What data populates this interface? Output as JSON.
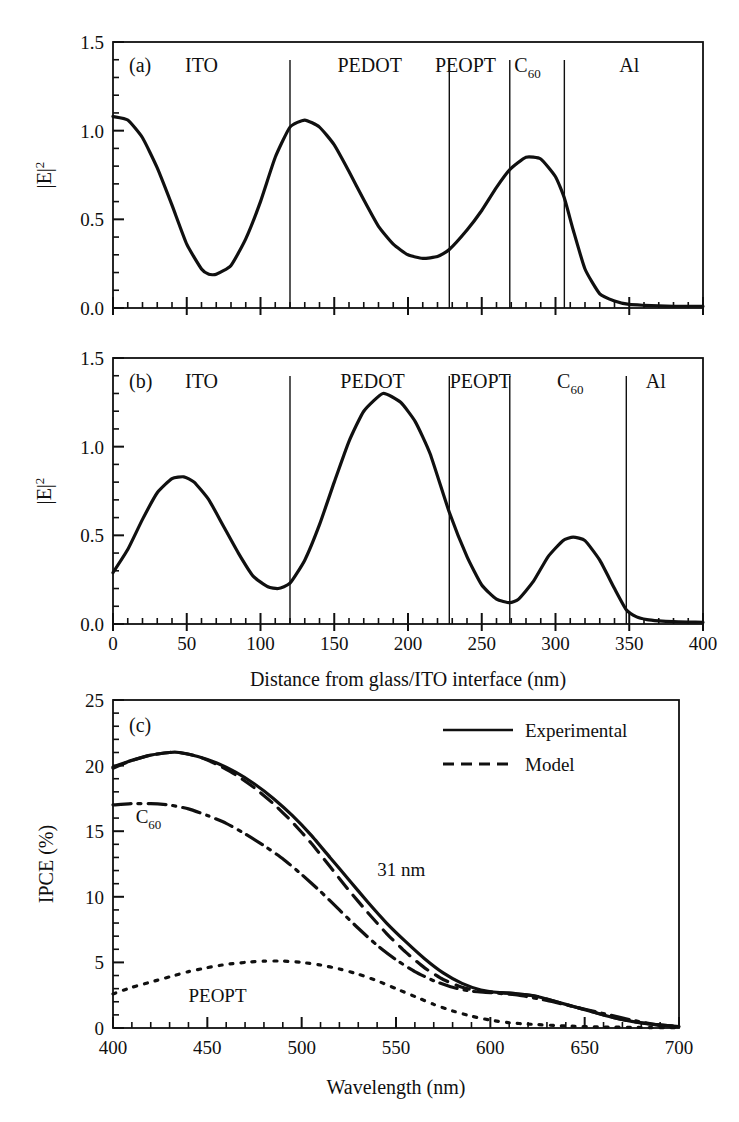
{
  "figure": {
    "background": "#ffffff",
    "ink_color": "#101010"
  },
  "panels": [
    {
      "id": "a",
      "label": "(a)",
      "xlabel": "",
      "ylabel": "|E|²",
      "ylabel_base": "|E|",
      "ylabel_exp": "2",
      "xticks": [
        0,
        50,
        100,
        150,
        200,
        250,
        300,
        350,
        400
      ],
      "xticklabels": [
        "",
        "",
        "",
        "",
        "",
        "",
        "",
        "",
        ""
      ],
      "yticks": [
        0.0,
        0.5,
        1.0,
        1.5
      ],
      "yticklabels": [
        "0.0",
        "0.5",
        "1.0",
        "1.5"
      ],
      "xlim": [
        0,
        400
      ],
      "ylim": [
        0,
        1.5
      ],
      "layers": [
        {
          "name": "ITO",
          "center_nm": 60
        },
        {
          "name": "PEDOT",
          "center_nm": 174
        },
        {
          "name": "PEOPT",
          "center_nm": 239,
          "compact": true
        },
        {
          "name": "C",
          "subscript": "60",
          "center_nm": 281,
          "compact": true
        },
        {
          "name": "Al",
          "center_nm": 350
        }
      ],
      "dividers_nm": [
        120,
        228,
        269,
        306
      ]
    },
    {
      "id": "b",
      "label": "(b)",
      "xlabel": "Distance from glass/ITO interface (nm)",
      "ylabel": "|E|²",
      "ylabel_base": "|E|",
      "ylabel_exp": "2",
      "xticks": [
        0,
        50,
        100,
        150,
        200,
        250,
        300,
        350,
        400
      ],
      "xticklabels": [
        "0",
        "50",
        "100",
        "150",
        "200",
        "250",
        "300",
        "350",
        "400"
      ],
      "yticks": [
        0.0,
        0.5,
        1.0,
        1.5
      ],
      "yticklabels": [
        "0.0",
        "0.5",
        "1.0",
        "1.5"
      ],
      "xlim": [
        0,
        400
      ],
      "ylim": [
        0,
        1.5
      ],
      "layers": [
        {
          "name": "ITO",
          "center_nm": 60
        },
        {
          "name": "PEDOT",
          "center_nm": 176
        },
        {
          "name": "PEOPT",
          "center_nm": 249
        },
        {
          "name": "C",
          "subscript": "60",
          "center_nm": 310
        },
        {
          "name": "Al",
          "center_nm": 368
        }
      ],
      "dividers_nm": [
        120,
        228,
        269,
        348
      ]
    },
    {
      "id": "c",
      "label": "(c)",
      "xlabel": "Wavelength (nm)",
      "ylabel": "IPCE (%)",
      "xticks": [
        400,
        450,
        500,
        550,
        600,
        650,
        700
      ],
      "xticklabels": [
        "400",
        "450",
        "500",
        "550",
        "600",
        "650",
        "700"
      ],
      "yticks": [
        0,
        5,
        10,
        15,
        20,
        25
      ],
      "yticklabels": [
        "0",
        "5",
        "10",
        "15",
        "20",
        "25"
      ],
      "xlim": [
        400,
        700
      ],
      "ylim": [
        0,
        25
      ],
      "legend": [
        {
          "label": "Experimental",
          "style": "solid"
        },
        {
          "label": "Model",
          "style": "dashed"
        }
      ],
      "annotations": [
        {
          "text": "31 nm",
          "x_nm": 540,
          "y_pct": 11.6
        },
        {
          "text": "C",
          "subscript": "60",
          "x_nm": 412,
          "y_pct": 15.6
        },
        {
          "text": "PEOPT",
          "x_nm": 440,
          "y_pct": 2.0
        }
      ]
    }
  ],
  "chart_data": [
    {
      "type": "line",
      "panel": "a",
      "title": "",
      "xlabel": "Distance from glass/ITO interface (nm)",
      "ylabel": "|E|^2",
      "xlim": [
        0,
        400
      ],
      "ylim": [
        0,
        1.5
      ],
      "grid": false,
      "layer_boundaries_nm": [
        120,
        228,
        269,
        306
      ],
      "layer_names": [
        "ITO",
        "PEDOT",
        "PEOPT",
        "C60",
        "Al"
      ],
      "series": [
        {
          "name": "|E|^2 (thin C60 device)",
          "style": "solid",
          "x": [
            0,
            10,
            20,
            30,
            40,
            50,
            60,
            65,
            70,
            80,
            90,
            100,
            110,
            120,
            130,
            140,
            150,
            160,
            170,
            180,
            190,
            200,
            210,
            220,
            228,
            240,
            250,
            260,
            269,
            280,
            290,
            300,
            306,
            312,
            320,
            330,
            340,
            350,
            360,
            370,
            380,
            390,
            400
          ],
          "y": [
            1.08,
            1.06,
            0.96,
            0.79,
            0.58,
            0.36,
            0.22,
            0.19,
            0.19,
            0.24,
            0.39,
            0.6,
            0.85,
            1.02,
            1.06,
            1.02,
            0.92,
            0.77,
            0.61,
            0.46,
            0.36,
            0.3,
            0.28,
            0.29,
            0.33,
            0.44,
            0.55,
            0.68,
            0.78,
            0.85,
            0.84,
            0.74,
            0.62,
            0.44,
            0.22,
            0.08,
            0.04,
            0.02,
            0.015,
            0.012,
            0.01,
            0.01,
            0.01
          ]
        }
      ]
    },
    {
      "type": "line",
      "panel": "b",
      "title": "",
      "xlabel": "Distance from glass/ITO interface (nm)",
      "ylabel": "|E|^2",
      "xlim": [
        0,
        400
      ],
      "ylim": [
        0,
        1.5
      ],
      "grid": false,
      "layer_boundaries_nm": [
        120,
        228,
        269,
        348
      ],
      "layer_names": [
        "ITO",
        "PEDOT",
        "PEOPT",
        "C60",
        "Al"
      ],
      "series": [
        {
          "name": "|E|^2 (thick C60 device)",
          "style": "solid",
          "x": [
            0,
            10,
            20,
            30,
            40,
            48,
            55,
            65,
            75,
            85,
            95,
            105,
            112,
            120,
            130,
            140,
            150,
            160,
            170,
            183,
            195,
            205,
            215,
            228,
            240,
            250,
            260,
            269,
            275,
            285,
            295,
            305,
            312,
            320,
            330,
            340,
            348,
            355,
            362,
            370,
            380,
            390,
            400
          ],
          "y": [
            0.29,
            0.42,
            0.59,
            0.74,
            0.82,
            0.83,
            0.8,
            0.7,
            0.55,
            0.4,
            0.27,
            0.21,
            0.2,
            0.23,
            0.36,
            0.56,
            0.8,
            1.03,
            1.2,
            1.3,
            1.25,
            1.14,
            0.96,
            0.63,
            0.38,
            0.22,
            0.14,
            0.12,
            0.14,
            0.24,
            0.38,
            0.47,
            0.49,
            0.47,
            0.36,
            0.2,
            0.08,
            0.04,
            0.025,
            0.018,
            0.013,
            0.011,
            0.01
          ]
        }
      ]
    },
    {
      "type": "line",
      "panel": "c",
      "title": "",
      "xlabel": "Wavelength (nm)",
      "ylabel": "IPCE (%)",
      "xlim": [
        400,
        700
      ],
      "ylim": [
        0,
        25
      ],
      "grid": false,
      "legend_position": "top-right",
      "annotations": [
        "31 nm",
        "C60",
        "PEOPT"
      ],
      "series": [
        {
          "name": "Experimental",
          "style": "solid",
          "x": [
            400,
            410,
            420,
            430,
            435,
            445,
            455,
            465,
            475,
            485,
            495,
            505,
            515,
            525,
            535,
            545,
            555,
            565,
            575,
            585,
            595,
            605,
            615,
            625,
            635,
            645,
            655,
            665,
            675,
            685,
            700
          ],
          "y": [
            19.9,
            20.4,
            20.8,
            21.0,
            21.0,
            20.7,
            20.2,
            19.5,
            18.6,
            17.5,
            16.2,
            14.7,
            13.0,
            11.3,
            9.6,
            8.0,
            6.6,
            5.3,
            4.2,
            3.4,
            2.9,
            2.7,
            2.6,
            2.4,
            2.0,
            1.6,
            1.2,
            0.8,
            0.5,
            0.3,
            0.1
          ]
        },
        {
          "name": "Model",
          "style": "dashed",
          "x": [
            400,
            410,
            420,
            430,
            435,
            445,
            455,
            465,
            475,
            485,
            495,
            505,
            515,
            525,
            535,
            545,
            555,
            565,
            575,
            585,
            595,
            605,
            615,
            625,
            635,
            645,
            655,
            665,
            675,
            685,
            700
          ],
          "y": [
            19.8,
            20.4,
            20.8,
            21.0,
            21.0,
            20.7,
            20.1,
            19.3,
            18.3,
            17.1,
            15.7,
            14.1,
            12.3,
            10.5,
            8.8,
            7.2,
            5.8,
            4.6,
            3.7,
            3.1,
            2.8,
            2.7,
            2.6,
            2.4,
            2.0,
            1.6,
            1.2,
            0.8,
            0.5,
            0.3,
            0.1
          ]
        },
        {
          "name": "C60",
          "style": "dash-dot",
          "x": [
            400,
            410,
            420,
            430,
            440,
            450,
            460,
            470,
            480,
            490,
            500,
            510,
            520,
            530,
            540,
            550,
            560,
            570,
            580,
            590,
            600,
            615,
            630,
            645,
            660,
            675,
            690,
            700
          ],
          "y": [
            17.0,
            17.1,
            17.1,
            17.0,
            16.7,
            16.2,
            15.6,
            14.8,
            13.9,
            12.9,
            11.7,
            10.4,
            9.0,
            7.6,
            6.3,
            5.2,
            4.3,
            3.6,
            3.1,
            2.8,
            2.7,
            2.5,
            2.1,
            1.6,
            1.1,
            0.6,
            0.2,
            0.1
          ]
        },
        {
          "name": "PEOPT",
          "style": "dotted",
          "x": [
            400,
            410,
            420,
            430,
            440,
            450,
            460,
            470,
            480,
            490,
            500,
            510,
            520,
            530,
            540,
            550,
            560,
            570,
            580,
            590,
            600,
            610,
            620,
            640,
            660,
            680,
            700
          ],
          "y": [
            2.6,
            3.1,
            3.5,
            3.9,
            4.3,
            4.6,
            4.85,
            5.0,
            5.1,
            5.1,
            5.0,
            4.8,
            4.5,
            4.1,
            3.6,
            3.0,
            2.4,
            1.8,
            1.3,
            0.9,
            0.6,
            0.4,
            0.3,
            0.15,
            0.08,
            0.04,
            0.02
          ]
        }
      ]
    }
  ]
}
